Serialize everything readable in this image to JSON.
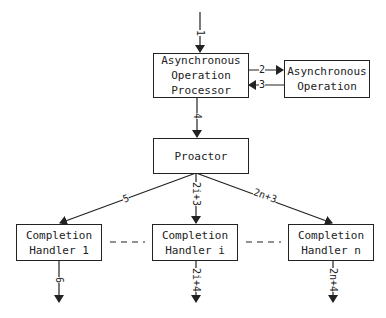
{
  "diagram": {
    "nodes": {
      "processor": {
        "line1": "Asynchronous",
        "line2": "Operation",
        "line3": "Processor"
      },
      "async_op": {
        "line1": "Asynchronous",
        "line2": "Operation"
      },
      "proactor": {
        "line1": "Proactor"
      },
      "handler_1": {
        "line1": "Completion",
        "line2": "Handler 1"
      },
      "handler_i": {
        "line1": "Completion",
        "line2": "Handler i"
      },
      "handler_n": {
        "line1": "Completion",
        "line2": "Handler n"
      }
    },
    "edges": {
      "e1": "1",
      "e2": "2",
      "e3": "3",
      "e4": "4",
      "e5": "5",
      "e6": "6",
      "e2i3": "2i+3",
      "e2i4": "2i+4",
      "e2n3": "2n+3",
      "e2n4": "2n+4"
    },
    "colors": {
      "line": "#222222",
      "background": "#ffffff"
    }
  }
}
